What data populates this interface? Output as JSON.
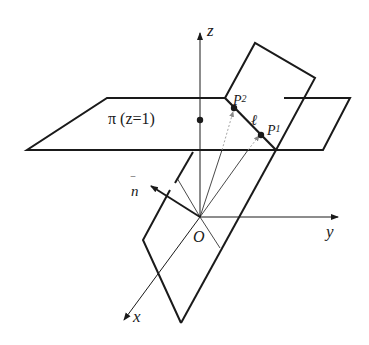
{
  "diagram": {
    "type": "3d-geometry",
    "labels": {
      "z_axis": "z",
      "y_axis": "y",
      "x_axis": "x",
      "origin": "O",
      "plane_pi": "π (z=1)",
      "normal": "n",
      "normal_bar": "‾",
      "line": "ℓ",
      "p2": "P",
      "p2_sub": "2",
      "p1": "P",
      "p1_sub": "1"
    },
    "colors": {
      "stroke": "#1a1a1a",
      "dotted": "#999999",
      "background": "#ffffff"
    }
  }
}
